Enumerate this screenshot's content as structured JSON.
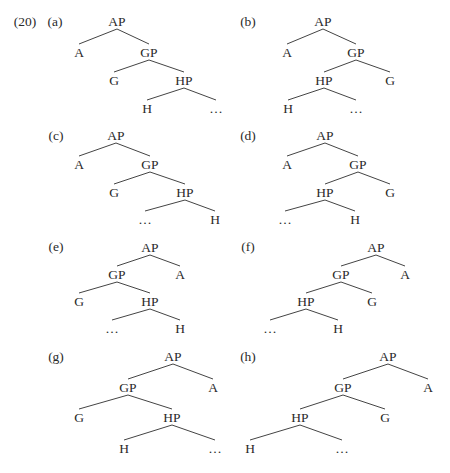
{
  "example_number": "(20)",
  "trees": [
    {
      "id": "a",
      "label": "(a)",
      "label_pos": [
        55,
        26
      ],
      "nodes": [
        {
          "id": "AP",
          "text": "AP",
          "x": 117,
          "y": 26
        },
        {
          "id": "A",
          "text": "A",
          "x": 79,
          "y": 57
        },
        {
          "id": "GP",
          "text": "GP",
          "x": 149,
          "y": 57
        },
        {
          "id": "G",
          "text": "G",
          "x": 114,
          "y": 85
        },
        {
          "id": "HP",
          "text": "HP",
          "x": 184,
          "y": 85
        },
        {
          "id": "H",
          "text": "H",
          "x": 147,
          "y": 113
        },
        {
          "id": "dots",
          "text": "…",
          "x": 216,
          "y": 113
        }
      ],
      "edges": [
        [
          "AP",
          "A"
        ],
        [
          "AP",
          "GP"
        ],
        [
          "GP",
          "G"
        ],
        [
          "GP",
          "HP"
        ],
        [
          "HP",
          "H"
        ],
        [
          "HP",
          "dots"
        ]
      ]
    },
    {
      "id": "b",
      "label": "(b)",
      "label_pos": [
        248,
        26
      ],
      "nodes": [
        {
          "id": "AP",
          "text": "AP",
          "x": 323,
          "y": 26
        },
        {
          "id": "A",
          "text": "A",
          "x": 287,
          "y": 57
        },
        {
          "id": "GP",
          "text": "GP",
          "x": 356,
          "y": 57
        },
        {
          "id": "HP",
          "text": "HP",
          "x": 324,
          "y": 85
        },
        {
          "id": "G",
          "text": "G",
          "x": 390,
          "y": 85
        },
        {
          "id": "H",
          "text": "H",
          "x": 288,
          "y": 113
        },
        {
          "id": "dots",
          "text": "…",
          "x": 356,
          "y": 113
        }
      ],
      "edges": [
        [
          "AP",
          "A"
        ],
        [
          "AP",
          "GP"
        ],
        [
          "GP",
          "HP"
        ],
        [
          "GP",
          "G"
        ],
        [
          "HP",
          "H"
        ],
        [
          "HP",
          "dots"
        ]
      ]
    },
    {
      "id": "c",
      "label": "(c)",
      "label_pos": [
        56,
        140
      ],
      "nodes": [
        {
          "id": "AP",
          "text": "AP",
          "x": 116,
          "y": 140
        },
        {
          "id": "A",
          "text": "A",
          "x": 79,
          "y": 169
        },
        {
          "id": "GP",
          "text": "GP",
          "x": 150,
          "y": 169
        },
        {
          "id": "G",
          "text": "G",
          "x": 114,
          "y": 197
        },
        {
          "id": "HP",
          "text": "HP",
          "x": 185,
          "y": 197
        },
        {
          "id": "dots",
          "text": "…",
          "x": 145,
          "y": 224
        },
        {
          "id": "H",
          "text": "H",
          "x": 215,
          "y": 224
        }
      ],
      "edges": [
        [
          "AP",
          "A"
        ],
        [
          "AP",
          "GP"
        ],
        [
          "GP",
          "G"
        ],
        [
          "GP",
          "HP"
        ],
        [
          "HP",
          "dots"
        ],
        [
          "HP",
          "H"
        ]
      ]
    },
    {
      "id": "d",
      "label": "(d)",
      "label_pos": [
        248,
        140
      ],
      "nodes": [
        {
          "id": "AP",
          "text": "AP",
          "x": 325,
          "y": 140
        },
        {
          "id": "A",
          "text": "A",
          "x": 287,
          "y": 169
        },
        {
          "id": "GP",
          "text": "GP",
          "x": 358,
          "y": 169
        },
        {
          "id": "HP",
          "text": "HP",
          "x": 325,
          "y": 197
        },
        {
          "id": "G",
          "text": "G",
          "x": 390,
          "y": 197
        },
        {
          "id": "dots",
          "text": "…",
          "x": 285,
          "y": 224
        },
        {
          "id": "H",
          "text": "H",
          "x": 355,
          "y": 224
        }
      ],
      "edges": [
        [
          "AP",
          "A"
        ],
        [
          "AP",
          "GP"
        ],
        [
          "GP",
          "HP"
        ],
        [
          "GP",
          "G"
        ],
        [
          "HP",
          "dots"
        ],
        [
          "HP",
          "H"
        ]
      ]
    },
    {
      "id": "e",
      "label": "(e)",
      "label_pos": [
        56,
        251
      ],
      "nodes": [
        {
          "id": "AP",
          "text": "AP",
          "x": 150,
          "y": 252
        },
        {
          "id": "GP",
          "text": "GP",
          "x": 117,
          "y": 279
        },
        {
          "id": "A",
          "text": "A",
          "x": 180,
          "y": 279
        },
        {
          "id": "G",
          "text": "G",
          "x": 79,
          "y": 306
        },
        {
          "id": "HP",
          "text": "HP",
          "x": 150,
          "y": 306
        },
        {
          "id": "dots",
          "text": "…",
          "x": 112,
          "y": 333
        },
        {
          "id": "H",
          "text": "H",
          "x": 180,
          "y": 333
        }
      ],
      "edges": [
        [
          "AP",
          "GP"
        ],
        [
          "AP",
          "A"
        ],
        [
          "GP",
          "G"
        ],
        [
          "GP",
          "HP"
        ],
        [
          "HP",
          "dots"
        ],
        [
          "HP",
          "H"
        ]
      ]
    },
    {
      "id": "f",
      "label": "(f)",
      "label_pos": [
        248,
        251
      ],
      "nodes": [
        {
          "id": "AP",
          "text": "AP",
          "x": 376,
          "y": 252
        },
        {
          "id": "GP",
          "text": "GP",
          "x": 341,
          "y": 279
        },
        {
          "id": "A",
          "text": "A",
          "x": 405,
          "y": 279
        },
        {
          "id": "HP",
          "text": "HP",
          "x": 306,
          "y": 306
        },
        {
          "id": "G",
          "text": "G",
          "x": 372,
          "y": 306
        },
        {
          "id": "dots",
          "text": "…",
          "x": 270,
          "y": 333
        },
        {
          "id": "H",
          "text": "H",
          "x": 338,
          "y": 333
        }
      ],
      "edges": [
        [
          "AP",
          "GP"
        ],
        [
          "AP",
          "A"
        ],
        [
          "GP",
          "HP"
        ],
        [
          "GP",
          "G"
        ],
        [
          "HP",
          "dots"
        ],
        [
          "HP",
          "H"
        ]
      ]
    },
    {
      "id": "g",
      "label": "(g)",
      "label_pos": [
        56,
        361
      ],
      "nodes": [
        {
          "id": "AP",
          "text": "AP",
          "x": 173,
          "y": 361
        },
        {
          "id": "GP",
          "text": "GP",
          "x": 128,
          "y": 392
        },
        {
          "id": "A",
          "text": "A",
          "x": 213,
          "y": 392
        },
        {
          "id": "G",
          "text": "G",
          "x": 79,
          "y": 422
        },
        {
          "id": "HP",
          "text": "HP",
          "x": 172,
          "y": 422
        },
        {
          "id": "H",
          "text": "H",
          "x": 124,
          "y": 453
        },
        {
          "id": "dots",
          "text": "…",
          "x": 215,
          "y": 453
        }
      ],
      "edges": [
        [
          "AP",
          "GP"
        ],
        [
          "AP",
          "A"
        ],
        [
          "GP",
          "G"
        ],
        [
          "GP",
          "HP"
        ],
        [
          "HP",
          "H"
        ],
        [
          "HP",
          "dots"
        ]
      ]
    },
    {
      "id": "h",
      "label": "(h)",
      "label_pos": [
        248,
        361
      ],
      "nodes": [
        {
          "id": "AP",
          "text": "AP",
          "x": 388,
          "y": 361
        },
        {
          "id": "GP",
          "text": "GP",
          "x": 343,
          "y": 392
        },
        {
          "id": "A",
          "text": "A",
          "x": 428,
          "y": 392
        },
        {
          "id": "HP",
          "text": "HP",
          "x": 300,
          "y": 422
        },
        {
          "id": "G",
          "text": "G",
          "x": 385,
          "y": 422
        },
        {
          "id": "H",
          "text": "H",
          "x": 250,
          "y": 453
        },
        {
          "id": "dots",
          "text": "…",
          "x": 342,
          "y": 453
        }
      ],
      "edges": [
        [
          "AP",
          "GP"
        ],
        [
          "AP",
          "A"
        ],
        [
          "GP",
          "HP"
        ],
        [
          "GP",
          "G"
        ],
        [
          "HP",
          "H"
        ],
        [
          "HP",
          "dots"
        ]
      ]
    }
  ],
  "colors": {
    "text": "#2a2a2a",
    "edge": "#444444",
    "background": "#ffffff"
  }
}
